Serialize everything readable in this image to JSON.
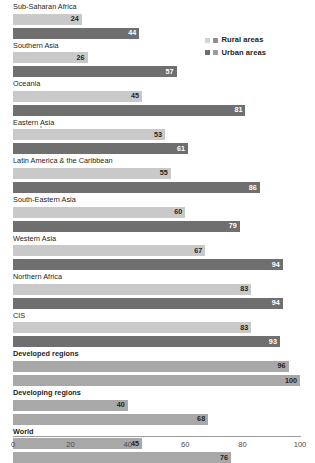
{
  "chart_data": {
    "type": "bar",
    "orientation": "horizontal",
    "title": "",
    "xlabel": "",
    "ylabel": "",
    "xlim": [
      0,
      100
    ],
    "xticks": [
      0,
      20,
      40,
      60,
      80,
      100
    ],
    "grid": false,
    "legend_position": "top-right",
    "categories": [
      "Sub-Saharan Africa",
      "Southern Asia",
      "Oceania",
      "Eastern Asia",
      "Latin America & the Caribbean",
      "South-Eastern Asia",
      "Western Asia",
      "Northern Africa",
      "CIS",
      "Developed regions",
      "Developing regions",
      "World"
    ],
    "emphasized_categories": [
      "Developed regions",
      "Developing regions",
      "World"
    ],
    "series": [
      {
        "name": "Rural areas",
        "values": [
          24,
          26,
          45,
          53,
          55,
          60,
          67,
          83,
          83,
          96,
          40,
          45
        ]
      },
      {
        "name": "Urban areas",
        "values": [
          44,
          57,
          81,
          61,
          86,
          79,
          94,
          94,
          93,
          100,
          68,
          76
        ]
      }
    ]
  },
  "legend": {
    "items": [
      {
        "label": "Rural areas",
        "swatch_a": "#d4d4d4",
        "swatch_b": "#8f8f8f"
      },
      {
        "label": "Urban areas",
        "swatch_a": "#6e6e6e",
        "swatch_b": "#9d9d9d"
      }
    ]
  },
  "colors": {
    "rural_bar": "#c9c9c9",
    "urban_bar": "#6f6f6f",
    "summary_bar": "#a8a8a8",
    "axis": "#9b9b9b",
    "text": "#231f20",
    "tick_text": "#4a4a4a"
  },
  "axis": {
    "ticks": [
      "0",
      "20",
      "40",
      "60",
      "80",
      "100"
    ]
  }
}
